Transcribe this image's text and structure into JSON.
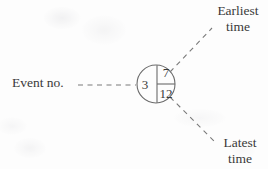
{
  "diagram": {
    "background_color": "#fdfdfd",
    "ink_color": "#6b6b6b",
    "text_color": "#3a3a3a",
    "node": {
      "shape": "circle",
      "center_x": 156,
      "center_y": 84,
      "radius": 19,
      "event_number": "3",
      "earliest_time": "7",
      "latest_time": "12"
    },
    "labels": {
      "event_no": "Event no.",
      "earliest_line1": "Earliest",
      "earliest_line2": "time",
      "latest_line1": "Latest",
      "latest_line2": "time"
    },
    "leader_lines": [
      {
        "name": "event-no-leader",
        "style": "dashed",
        "from_x": 78,
        "from_y": 85,
        "to_x": 136,
        "to_y": 85
      },
      {
        "name": "earliest-time-leader",
        "style": "dashed",
        "from_x": 170,
        "from_y": 72,
        "to_x": 212,
        "to_y": 28
      },
      {
        "name": "latest-time-leader",
        "style": "dashed",
        "from_x": 170,
        "from_y": 97,
        "to_x": 214,
        "to_y": 141
      }
    ]
  }
}
